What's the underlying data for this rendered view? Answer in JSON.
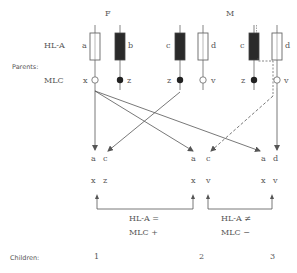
{
  "parents": {
    "row_label": "Parents:",
    "father_label": "F",
    "mother_label": "M",
    "hla_label": "HL-A",
    "mlc_label": "MLC",
    "father_chromosomes": [
      {
        "hla": "a",
        "mlc": "x",
        "fill": "open"
      },
      {
        "hla": "b",
        "mlc": "z",
        "fill": "solid"
      }
    ],
    "mother_chromosomes_left": [
      {
        "hla": "c",
        "mlc": "z",
        "fill": "solid"
      },
      {
        "hla": "d",
        "mlc": "v",
        "fill": "open"
      }
    ],
    "mother_chromosomes_right": [
      {
        "hla": "c",
        "mlc": "z",
        "fill": "solid"
      },
      {
        "hla": "d",
        "mlc": "v",
        "fill": "open",
        "recombinant": true
      }
    ]
  },
  "offspring": [
    {
      "hla": [
        "a",
        "c"
      ],
      "mlc": [
        "x",
        "z"
      ],
      "number": "1"
    },
    {
      "hla": [
        "a",
        "c"
      ],
      "mlc": [
        "x",
        "v"
      ],
      "number": "2"
    },
    {
      "hla": [
        "a",
        "d"
      ],
      "mlc": [
        "x",
        "v"
      ],
      "number": "3"
    }
  ],
  "comparisons": [
    {
      "hla_text": "HL-A =",
      "mlc_text": "MLC +"
    },
    {
      "hla_text": "HL-A ≠",
      "mlc_text": "MLC −"
    }
  ],
  "children_label": "Children:",
  "colors": {
    "line": "#555555",
    "solid_fill": "#2a2a2a",
    "text": "#555555"
  }
}
